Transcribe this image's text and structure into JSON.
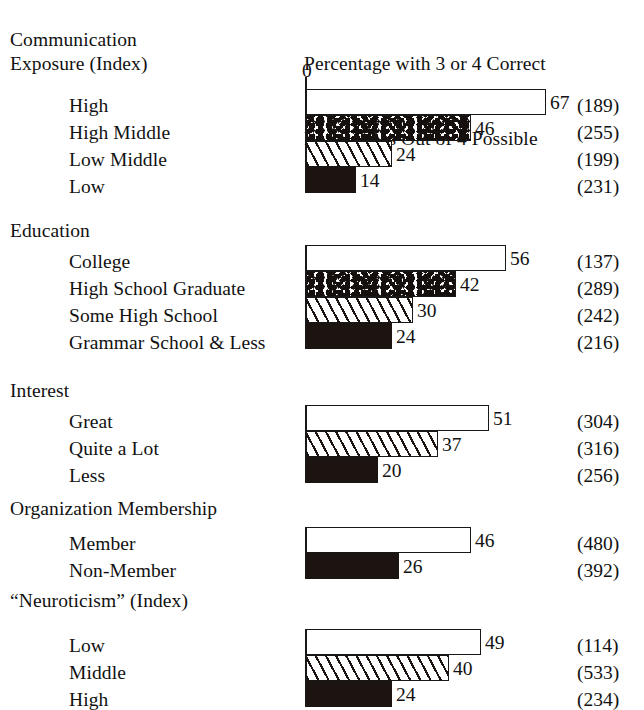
{
  "chart_data": {
    "type": "bar",
    "orientation": "horizontal",
    "title": "Percentage with 3 or 4 Correct Perceptions Out of 4 Possible",
    "title_lines": [
      "Percentage with 3 or 4 Correct",
      "Perceptions Out of 4 Possible"
    ],
    "xlabel": "",
    "ylabel": "",
    "axis_origin_label": "0",
    "xlim": [
      0,
      70
    ],
    "grid": false,
    "legend": null,
    "value_suffix": "",
    "n_column_header": "",
    "groups": [
      {
        "heading": "Communication Exposure (Index)",
        "heading_lines": [
          "Communication",
          "Exposure (Index)"
        ],
        "categories": [
          "High",
          "High Middle",
          "Low Middle",
          "Low"
        ],
        "values": [
          67,
          46,
          24,
          14
        ],
        "n": [
          189,
          255,
          199,
          231
        ],
        "n_labels": [
          "(189)",
          "(255)",
          "(199)",
          "(231)"
        ],
        "fills": [
          "white",
          "stipple",
          "hatch",
          "black"
        ]
      },
      {
        "heading": "Education",
        "heading_lines": [
          "Education"
        ],
        "categories": [
          "College",
          "High School Graduate",
          "Some High School",
          "Grammar School & Less"
        ],
        "values": [
          56,
          42,
          30,
          24
        ],
        "n": [
          137,
          289,
          242,
          216
        ],
        "n_labels": [
          "(137)",
          "(289)",
          "(242)",
          "(216)"
        ],
        "fills": [
          "white",
          "stipple",
          "hatch",
          "black"
        ]
      },
      {
        "heading": "Interest",
        "heading_lines": [
          "Interest"
        ],
        "categories": [
          "Great",
          "Quite a Lot",
          "Less"
        ],
        "values": [
          51,
          37,
          20
        ],
        "n": [
          304,
          316,
          256
        ],
        "n_labels": [
          "(304)",
          "(316)",
          "(256)"
        ],
        "fills": [
          "white",
          "hatch",
          "black"
        ]
      },
      {
        "heading": "Organization Membership",
        "heading_lines": [
          "Organization Membership"
        ],
        "categories": [
          "Member",
          "Non-Member"
        ],
        "values": [
          46,
          26
        ],
        "n": [
          480,
          392
        ],
        "n_labels": [
          "(480)",
          "(392)"
        ],
        "fills": [
          "white",
          "black"
        ]
      },
      {
        "heading": "“Neuroticism” (Index)",
        "heading_lines": [
          "“Neuroticism” (Index)"
        ],
        "categories": [
          "Low",
          "Middle",
          "High"
        ],
        "values": [
          49,
          40,
          24
        ],
        "n": [
          114,
          533,
          234
        ],
        "n_labels": [
          "(114)",
          "(533)",
          "(234)"
        ],
        "fills": [
          "white",
          "hatch",
          "black"
        ]
      }
    ]
  },
  "style": {
    "ink_color": "#1b1411",
    "paper_color": "#ffffff"
  },
  "layout": {
    "axis_x_px": 306,
    "px_per_unit": 3.58,
    "bar_height_px": 26,
    "group_tops_px": [
      89,
      245,
      405,
      527,
      629
    ],
    "heading_tops_px": [
      28,
      219,
      379,
      497,
      589
    ],
    "label_tops_px": [
      [
        96,
        123,
        150,
        177
      ],
      [
        252,
        279,
        306,
        333
      ],
      [
        412,
        439,
        466
      ],
      [
        534,
        561
      ],
      [
        636,
        663,
        690
      ]
    ]
  }
}
